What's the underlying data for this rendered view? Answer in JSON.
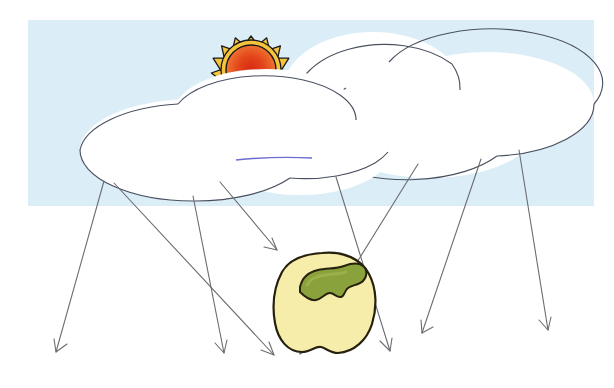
{
  "illustration": {
    "title": "Sunlight scattering through clouds onto a yellow bell pepper",
    "canvas": {
      "width": 614,
      "height": 388
    },
    "background": {
      "page_color": "#ffffff",
      "sky_color": "#dbeef7",
      "sky_rect": {
        "x": 28,
        "y": 20,
        "width": 566,
        "height": 186
      }
    },
    "sun": {
      "label": "sun",
      "center": {
        "x": 251,
        "y": 70
      },
      "core_radius": 25,
      "ray_count": 13,
      "ray_length": 9,
      "corona_color": "#f6c43c",
      "corona_outline": "#1a1a1a",
      "core_center_color": "#d92a12",
      "core_mid_color": "#e8551f",
      "core_edge_color": "#f2813a",
      "core_outline": "#1a1a1a"
    },
    "clouds": [
      {
        "label": "cloud-back-right",
        "fill": "#ffffff",
        "outline": "#4a5060",
        "lobes": [
          {
            "cx": 373,
            "cy": 90,
            "rx": 90,
            "ry": 58
          },
          {
            "cx": 487,
            "cy": 104,
            "rx": 107,
            "ry": 52
          },
          {
            "cx": 430,
            "cy": 126,
            "rx": 108,
            "ry": 52
          }
        ]
      },
      {
        "label": "cloud-front-left",
        "fill": "#ffffff",
        "outline": "#4a5060",
        "lobes": [
          {
            "cx": 266,
            "cy": 113,
            "rx": 92,
            "ry": 44
          },
          {
            "cx": 193,
            "cy": 150,
            "rx": 113,
            "ry": 51
          },
          {
            "cx": 300,
            "cy": 150,
            "rx": 92,
            "ry": 45
          }
        ]
      }
    ],
    "accent_stroke": {
      "label": "violet-cloud-seam",
      "color": "#6b6bd0",
      "from": {
        "x": 236,
        "y": 160
      },
      "to": {
        "x": 312,
        "y": 158
      }
    },
    "rays": {
      "label": "light-rays",
      "color": "#6b6b72",
      "stroke_width": 1.1,
      "arrowhead_length": 11,
      "arrowhead_spread": 15,
      "count": 8,
      "lines": [
        {
          "name": "ray-1",
          "x1": 104,
          "y1": 181,
          "x2": 56,
          "y2": 352
        },
        {
          "name": "ray-2",
          "x1": 193,
          "y1": 196,
          "x2": 224,
          "y2": 353
        },
        {
          "name": "ray-3",
          "x1": 114,
          "y1": 183,
          "x2": 274,
          "y2": 355
        },
        {
          "name": "ray-4",
          "x1": 220,
          "y1": 182,
          "x2": 277,
          "y2": 250
        },
        {
          "name": "ray-5",
          "x1": 336,
          "y1": 177,
          "x2": 390,
          "y2": 351
        },
        {
          "name": "ray-6",
          "x1": 418,
          "y1": 164,
          "x2": 300,
          "y2": 354
        },
        {
          "name": "ray-7",
          "x1": 481,
          "y1": 159,
          "x2": 422,
          "y2": 333
        },
        {
          "name": "ray-8",
          "x1": 519,
          "y1": 150,
          "x2": 548,
          "y2": 330
        }
      ]
    },
    "pepper": {
      "label": "yellow-bell-pepper",
      "body_fill": "#f7edab",
      "body_outline": "#26210d",
      "stem_fill": "#8aa23c",
      "stem_outline": "#26210d",
      "stem_highlight": "#9cb04a",
      "bounds": {
        "x": 275,
        "y": 253,
        "width": 100,
        "height": 100
      }
    }
  }
}
